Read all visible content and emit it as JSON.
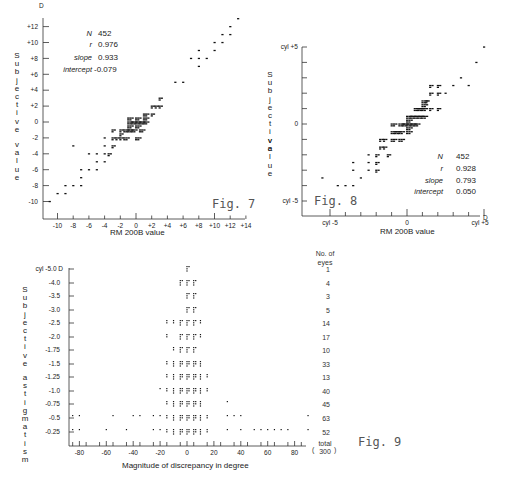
{
  "chart_data": [
    {
      "id": "fig7",
      "type": "scatter",
      "figure_label": "Fig. 7",
      "xlabel": "RM 200B value",
      "ylabel": "Subjective value",
      "unit": "D",
      "xlim": [
        -11,
        14
      ],
      "ylim": [
        -11,
        13
      ],
      "x_ticks": [
        "-10",
        "-8",
        "-6",
        "-4",
        "-2",
        "0",
        "+2",
        "+4",
        "+6",
        "+8",
        "+10",
        "+12",
        "+14"
      ],
      "y_ticks": [
        "+12",
        "+10",
        "+8",
        "+6",
        "+4",
        "+2",
        "0",
        "-2",
        "-4",
        "-6",
        "-8",
        "-10"
      ],
      "stats": {
        "N": "452",
        "r": "0.976",
        "slope": "0.933",
        "intercept": "-0.079"
      },
      "points": [
        [
          -11,
          -10
        ],
        [
          -10,
          -9
        ],
        [
          -9,
          -9
        ],
        [
          -9,
          -8
        ],
        [
          -8,
          -8
        ],
        [
          -8,
          -3
        ],
        [
          -7,
          -8
        ],
        [
          -7,
          -7
        ],
        [
          -7,
          -6
        ],
        [
          -6,
          -6
        ],
        [
          -6,
          -4
        ],
        [
          -5,
          -6
        ],
        [
          -5,
          -5
        ],
        [
          -5,
          -4
        ],
        [
          -4,
          -5
        ],
        [
          -4,
          -4
        ],
        [
          -4,
          -3
        ],
        [
          -4,
          -2
        ],
        [
          -3.5,
          -4
        ],
        [
          -3,
          -3
        ],
        [
          -3,
          -2
        ],
        [
          -3,
          -1
        ],
        [
          -2.5,
          -2
        ],
        [
          -2,
          -2
        ],
        [
          -2,
          -1.5
        ],
        [
          -2,
          -1
        ],
        [
          -1.5,
          -2
        ],
        [
          -1.5,
          -1
        ],
        [
          -1,
          -1
        ],
        [
          -1,
          -0.5
        ],
        [
          -1,
          0
        ],
        [
          -1,
          0.5
        ],
        [
          -0.5,
          0
        ],
        [
          -0.5,
          -1
        ],
        [
          0,
          0
        ],
        [
          0,
          0.5
        ],
        [
          0,
          -0.5
        ],
        [
          0,
          -2
        ],
        [
          0.5,
          0
        ],
        [
          0.5,
          -1
        ],
        [
          1,
          0
        ],
        [
          1,
          1
        ],
        [
          1,
          0.5
        ],
        [
          2,
          1
        ],
        [
          2,
          2
        ],
        [
          2.5,
          2
        ],
        [
          3,
          2
        ],
        [
          3,
          3
        ],
        [
          5,
          5
        ],
        [
          6,
          5
        ],
        [
          7,
          8
        ],
        [
          8,
          7
        ],
        [
          8,
          8
        ],
        [
          8,
          9
        ],
        [
          9,
          8
        ],
        [
          10,
          9
        ],
        [
          10,
          10
        ],
        [
          11,
          10
        ],
        [
          11,
          11
        ],
        [
          12,
          11
        ],
        [
          12,
          12
        ],
        [
          13,
          13
        ]
      ]
    },
    {
      "id": "fig8",
      "type": "scatter",
      "figure_label": "Fig. 8",
      "xlabel": "RM 200B value",
      "ylabel": "Subjective value",
      "unit": "D",
      "xlim": [
        -5.5,
        5
      ],
      "ylim": [
        -5,
        5
      ],
      "x_ticks": [
        "cyl -5",
        "0",
        "cyl +5"
      ],
      "y_ticks": [
        "cyl +5",
        "0",
        "cyl -5"
      ],
      "stats": {
        "N": "452",
        "r": "0.928",
        "slope": "0.793",
        "intercept": "0.050"
      },
      "points": [
        [
          -5.5,
          -3.5
        ],
        [
          -4.5,
          -4
        ],
        [
          -4,
          -4
        ],
        [
          -3.5,
          -4
        ],
        [
          -3.5,
          -3
        ],
        [
          -3.5,
          -2.5
        ],
        [
          -3,
          -3.5
        ],
        [
          -2.5,
          -2
        ],
        [
          -2.5,
          -2.5
        ],
        [
          -2.5,
          -3
        ],
        [
          -2,
          -2
        ],
        [
          -2,
          -2.5
        ],
        [
          -2,
          -3
        ],
        [
          -1.75,
          -1
        ],
        [
          -1.75,
          -1.5
        ],
        [
          -1.5,
          -1.5
        ],
        [
          -1.5,
          -1
        ],
        [
          -1.25,
          -2
        ],
        [
          -1,
          -1
        ],
        [
          -1,
          -0.5
        ],
        [
          -1,
          0
        ],
        [
          -0.75,
          -0.5
        ],
        [
          -0.5,
          0
        ],
        [
          -0.5,
          -0.5
        ],
        [
          -0.5,
          -1
        ],
        [
          -0.25,
          0
        ],
        [
          0,
          0
        ],
        [
          0,
          0.25
        ],
        [
          0,
          -0.25
        ],
        [
          0,
          0.5
        ],
        [
          0,
          -0.5
        ],
        [
          0.25,
          0
        ],
        [
          0.25,
          0.5
        ],
        [
          0.5,
          0.5
        ],
        [
          0.5,
          0
        ],
        [
          0.5,
          1
        ],
        [
          0.75,
          1
        ],
        [
          0.75,
          0.5
        ],
        [
          1,
          1
        ],
        [
          1,
          1.5
        ],
        [
          1,
          1.25
        ],
        [
          1,
          0.5
        ],
        [
          1.25,
          1.5
        ],
        [
          1.5,
          1
        ],
        [
          1.5,
          2
        ],
        [
          1.5,
          2.5
        ],
        [
          2,
          2
        ],
        [
          2,
          1
        ],
        [
          2,
          2.5
        ],
        [
          2.5,
          2
        ],
        [
          3,
          2.5
        ],
        [
          3.5,
          3
        ],
        [
          4,
          2.5
        ],
        [
          4.5,
          4
        ],
        [
          5,
          5
        ]
      ]
    },
    {
      "id": "fig9",
      "type": "scatter",
      "figure_label": "Fig. 9",
      "xlabel": "Magnitude of discrepancy in degree",
      "ylabel": "Subjective astigmatism",
      "unit": "D",
      "xlim": [
        -90,
        90
      ],
      "x_ticks": [
        "-80",
        "-60",
        "-40",
        "-20",
        "0",
        "20",
        "40",
        "60",
        "80"
      ],
      "y_categories": [
        "cyl -5.0 D",
        "-4.0",
        "-3.5",
        "-3.0",
        "-2.5",
        "-2.0",
        "-1.75",
        "-1.5",
        "-1.25",
        "-1.0",
        "-0.75",
        "-0.5",
        "-0.25"
      ],
      "counts_header": "No. of eyes",
      "counts": [
        "1",
        "4",
        "3",
        "5",
        "14",
        "17",
        "10",
        "33",
        "13",
        "40",
        "45",
        "63",
        "52"
      ],
      "total_label": "total",
      "total": "300",
      "points_by_row": [
        [
          0
        ],
        [
          -5,
          0,
          5
        ],
        [
          0,
          5
        ],
        [
          0,
          5
        ],
        [
          -15,
          -10,
          -5,
          0,
          5,
          10
        ],
        [
          -15,
          -5,
          0,
          5,
          10
        ],
        [
          -10,
          -5,
          0,
          5
        ],
        [
          -15,
          -10,
          -5,
          0,
          5,
          10
        ],
        [
          -15,
          -10,
          -5,
          0,
          5,
          10,
          15
        ],
        [
          -20,
          -15,
          -10,
          -5,
          0,
          5,
          10,
          15
        ],
        [
          -15,
          -10,
          -5,
          0,
          5,
          10,
          30
        ],
        [
          -85,
          -80,
          -55,
          -40,
          -35,
          -25,
          -20,
          -15,
          -10,
          -5,
          0,
          5,
          10,
          15,
          30,
          35,
          40,
          90
        ],
        [
          -85,
          -80,
          -60,
          -45,
          -25,
          -20,
          -15,
          -10,
          -5,
          0,
          5,
          10,
          15,
          30,
          40,
          50,
          55,
          60,
          65,
          70,
          75,
          90
        ]
      ]
    }
  ],
  "fig7": {
    "label": "Fig. 7",
    "unit": "D",
    "xlabel": "RM 200B value",
    "ylabel": "Subjective value",
    "stat_labels": [
      "N",
      "r",
      "slope",
      "intercept"
    ],
    "stat_values": [
      "452",
      "0.976",
      "0.933",
      "-0.079"
    ]
  },
  "fig8": {
    "label": "Fig. 8",
    "unit": "D",
    "xlabel": "RM 200B value",
    "ylabel": "Subjective value",
    "stat_labels": [
      "N",
      "r",
      "slope",
      "intercept"
    ],
    "stat_values": [
      "452",
      "0.928",
      "0.793",
      "0.050"
    ]
  },
  "fig9": {
    "label": "Fig. 9",
    "xlabel": "Magnitude of discrepancy in degree",
    "ylabel": "Subjective astigmatism",
    "counts_header_1": "No. of",
    "counts_header_2": "eyes",
    "total_label": "total",
    "total": "300"
  }
}
